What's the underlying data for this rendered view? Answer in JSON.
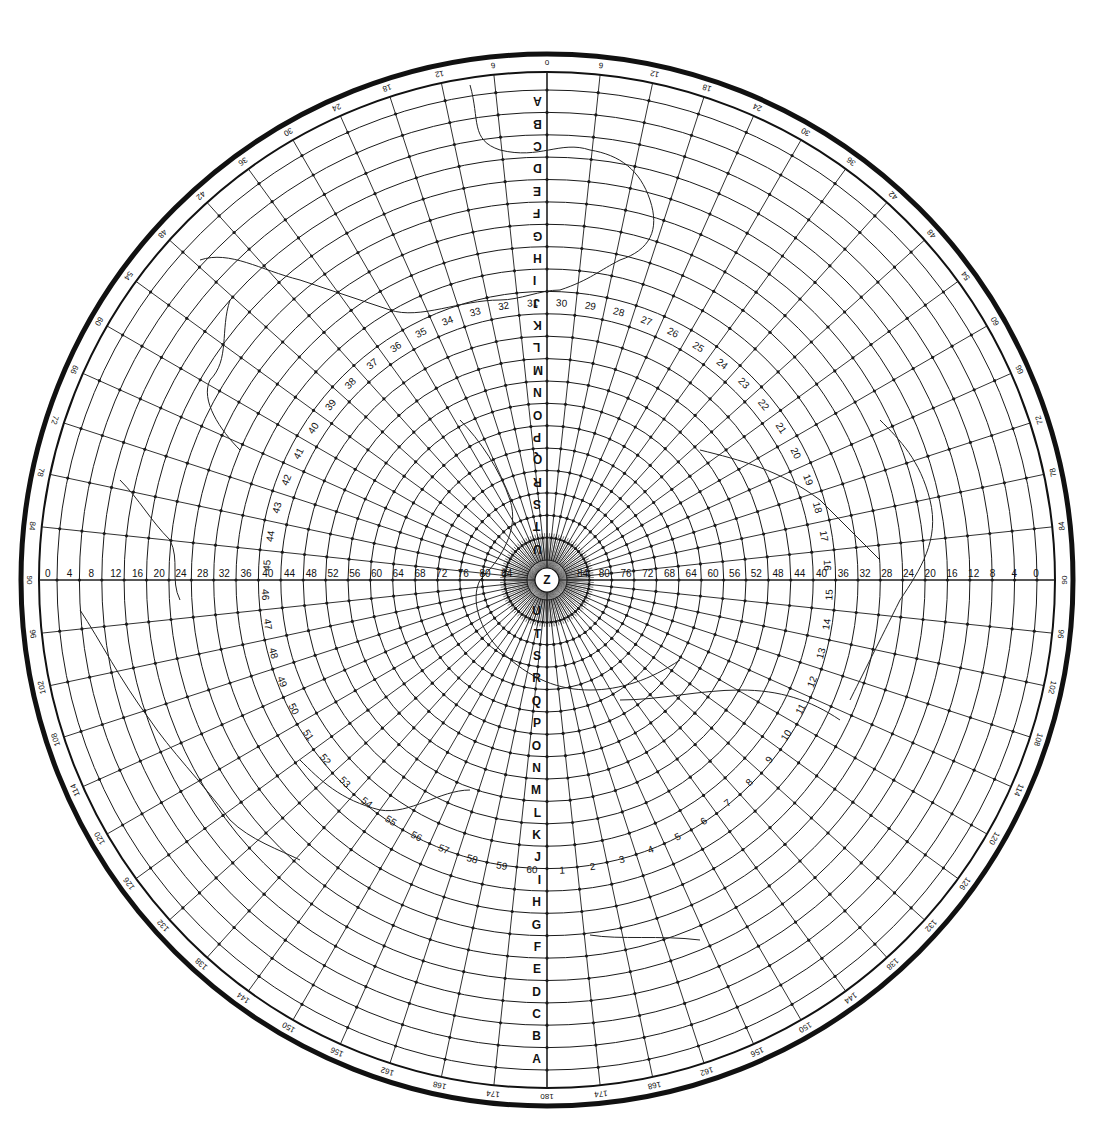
{
  "chart_data": {
    "type": "polar-grid",
    "title": "",
    "center": {
      "x": 547,
      "y": 580,
      "label": "Z"
    },
    "outer_radius": 490,
    "frame": {
      "outer_ring_radius": 526,
      "outer_ring_width": 5,
      "inner_ring_radius": 508,
      "inner_ring_width": 2
    },
    "rings": {
      "count": 21,
      "letters_outer_to_inner": [
        "A",
        "B",
        "C",
        "D",
        "E",
        "F",
        "G",
        "H",
        "I",
        "J",
        "K",
        "L",
        "M",
        "N",
        "O",
        "P",
        "Q",
        "R",
        "S",
        "T",
        "U"
      ],
      "inner_radius": 20
    },
    "radial_line_spacing_deg": 6,
    "azimuth_labels": {
      "right_side": [
        "0",
        "6",
        "12",
        "18",
        "24",
        "30",
        "36",
        "42",
        "48",
        "54",
        "60",
        "66",
        "72",
        "78",
        "84",
        "90",
        "96",
        "102",
        "108",
        "114",
        "120",
        "126",
        "132",
        "138",
        "144",
        "150",
        "156",
        "162",
        "168",
        "174",
        "180"
      ],
      "left_side": [
        "0",
        "6",
        "12",
        "18",
        "24",
        "30",
        "36",
        "42",
        "48",
        "54",
        "60",
        "66",
        "72",
        "78",
        "84",
        "90",
        "96",
        "102",
        "108",
        "114",
        "120",
        "126",
        "132",
        "138",
        "144",
        "150",
        "156",
        "162",
        "168",
        "174",
        "180"
      ]
    },
    "horizontal_scale": {
      "left": [
        "0",
        "4",
        "8",
        "12",
        "16",
        "20",
        "24",
        "28",
        "32",
        "36",
        "40",
        "44",
        "48",
        "52",
        "56",
        "60",
        "64",
        "68",
        "72",
        "76",
        "80",
        "84"
      ],
      "right": [
        "84",
        "80",
        "76",
        "72",
        "68",
        "64",
        "60",
        "56",
        "52",
        "48",
        "44",
        "40",
        "36",
        "32",
        "28",
        "24",
        "20",
        "16",
        "12",
        "8",
        "4",
        "0"
      ]
    },
    "spiral_numbers": [
      "1",
      "2",
      "3",
      "4",
      "5",
      "6",
      "7",
      "8",
      "9",
      "10",
      "11",
      "12",
      "13",
      "14",
      "15",
      "16",
      "17",
      "18",
      "19",
      "20",
      "21",
      "22",
      "23",
      "24",
      "25",
      "26",
      "27",
      "28",
      "29",
      "30",
      "31",
      "32",
      "33",
      "34",
      "35",
      "36",
      "37",
      "38",
      "39",
      "40",
      "41",
      "42",
      "43",
      "44",
      "45",
      "46",
      "47",
      "48",
      "49",
      "50",
      "51",
      "52",
      "53",
      "54",
      "55",
      "56",
      "57",
      "58",
      "59",
      "60"
    ],
    "grid": true,
    "colors": {
      "line": "#1a1a1a",
      "background": "#ffffff",
      "coastline": "#222222"
    }
  }
}
